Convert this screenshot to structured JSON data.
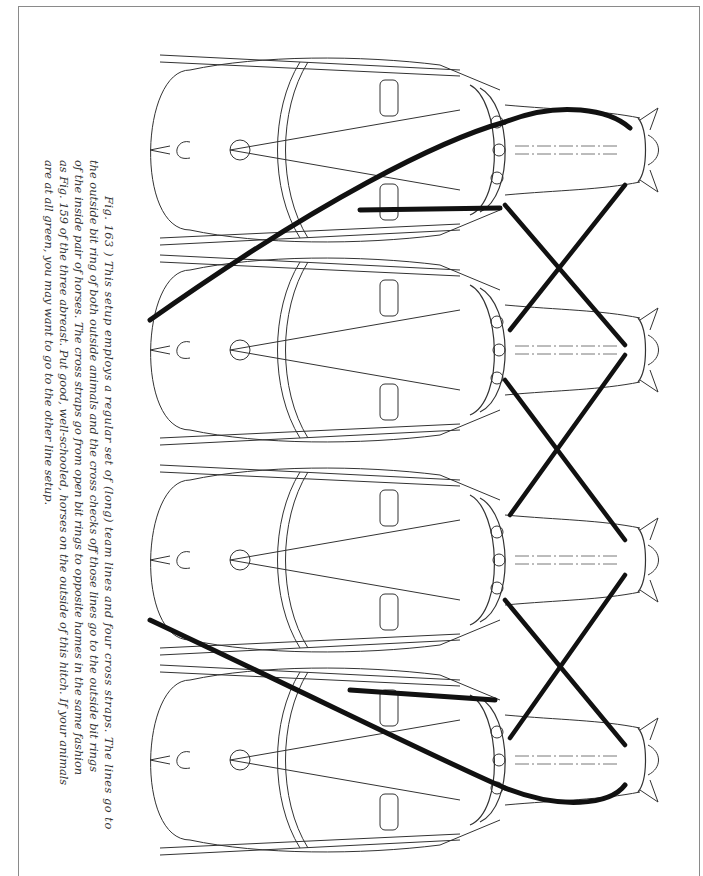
{
  "page": {
    "header_fragment": "",
    "figure_number": "163",
    "caption_lines": [
      "Fig.  163 ) This setup employs a regular set of (long) team lines and four cross straps. The lines go to",
      "the outside bit ring of both outside animals and the cross checks off those lines go to the outside bit rings",
      "of the inside pair of horses. The cross straps go from open bit rings to opposite hames in the same fashion",
      "as Fig. 159 of the three abreast. Put good, well-schooled, horses on the outside of this hitch. If your animals",
      "are at all green, you may want to go to the other line setup."
    ]
  },
  "illustration": {
    "subject": "four-abreast team hitch viewed from above",
    "horses": [
      {
        "label": "horse-1",
        "center_y": 150
      },
      {
        "label": "horse-2",
        "center_y": 350
      },
      {
        "label": "horse-3",
        "center_y": 560
      },
      {
        "label": "horse-4",
        "center_y": 760
      }
    ],
    "line_color": "#111111",
    "outline_color": "#333333"
  }
}
